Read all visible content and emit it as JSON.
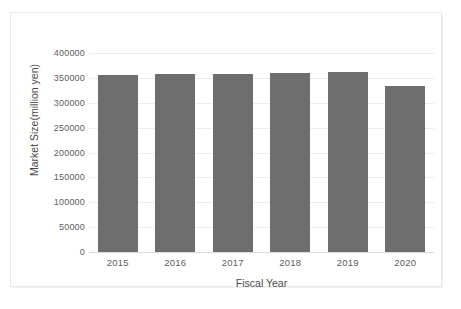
{
  "chart_data": {
    "type": "bar",
    "title": "",
    "subtitle": "",
    "xlabel": "Fiscal Year",
    "ylabel": "Market Size(million yen)",
    "categories": [
      "2015",
      "2016",
      "2017",
      "2018",
      "2019",
      "2020"
    ],
    "values": [
      355000,
      357000,
      358000,
      359000,
      361000,
      334000
    ],
    "series": [
      {
        "name": "Market Size",
        "values": [
          355000,
          357000,
          358000,
          359000,
          361000,
          334000
        ],
        "color": "#6e6e6e"
      }
    ],
    "ylim": [
      0,
      400000
    ],
    "ytick_step": 50000,
    "ytick_labels": [
      "0",
      "50000",
      "100000",
      "150000",
      "200000",
      "250000",
      "300000",
      "350000",
      "400000"
    ],
    "ytick_values": [
      0,
      50000,
      100000,
      150000,
      200000,
      250000,
      300000,
      350000,
      400000
    ],
    "xtick_labels": [
      "2015",
      "2016",
      "2017",
      "2018",
      "2019",
      "2020"
    ],
    "grid": "horizontal",
    "legend": "none",
    "bar_color": "#6e6e6e",
    "gridline_color": "#ededed",
    "axis_color": "#d9d9d9",
    "background": "#ffffff"
  }
}
